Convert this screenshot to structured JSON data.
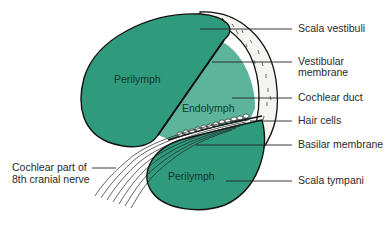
{
  "figure": {
    "colors": {
      "perilymph": "#2f9a7c",
      "endolymph": "#5cb59a",
      "bone": "#f4f4f0",
      "outline": "#111111",
      "label_text": "#2a2a2a"
    },
    "regions": {
      "perilymph_upper": "Perilymph",
      "endolymph": "Endolymph",
      "perilymph_lower": "Perilymph"
    },
    "labels": {
      "scala_vestibuli": "Scala vestibuli",
      "vestibular_membrane_1": "Vestibular",
      "vestibular_membrane_2": "membrane",
      "cochlear_duct": "Cochlear duct",
      "hair_cells": "Hair cells",
      "basilar_membrane": "Basilar membrane",
      "scala_tympani": "Scala tympani",
      "nerve_1": "Cochlear part of",
      "nerve_2": "8th cranial nerve"
    }
  }
}
